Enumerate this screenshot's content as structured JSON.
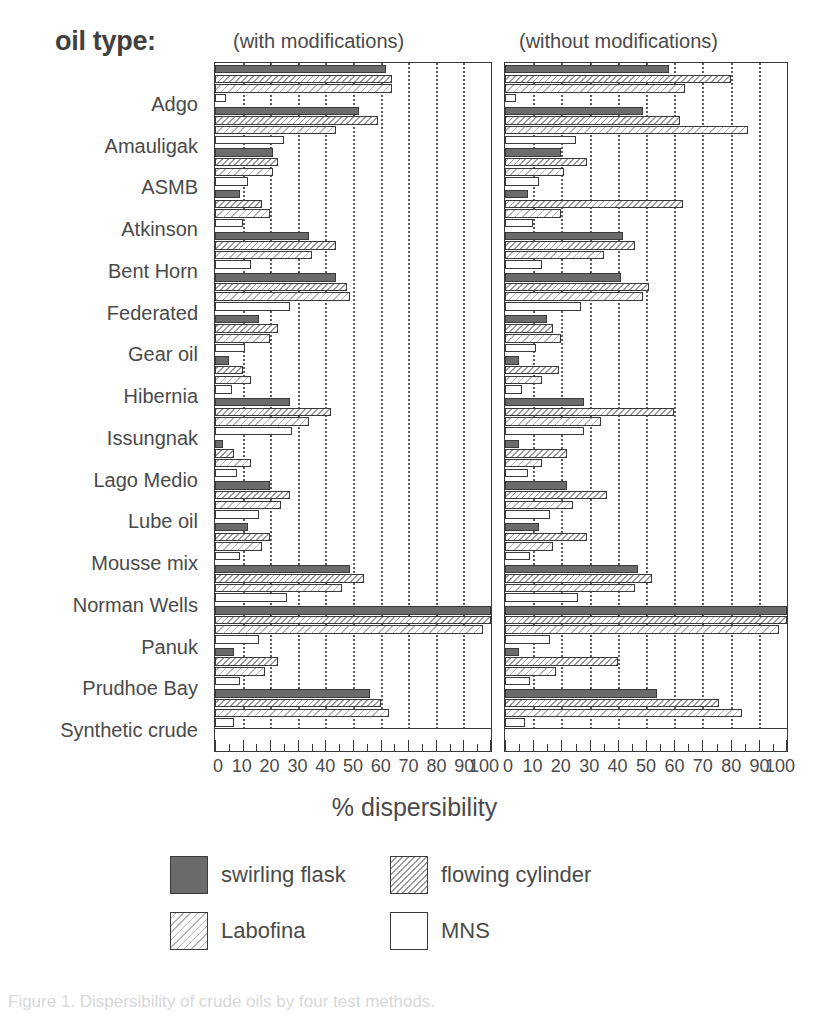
{
  "header": {
    "oil_type_label": "oil type:",
    "panel_left_title": "(with modifications)",
    "panel_right_title": "(without modifications)"
  },
  "axis": {
    "xlabel": "% dispersibility",
    "ticks": [
      "0",
      "10",
      "20",
      "30",
      "40",
      "50",
      "60",
      "70",
      "80",
      "90",
      "100"
    ]
  },
  "legend": {
    "items": [
      {
        "name": "swirling flask",
        "pattern": "solid-dark"
      },
      {
        "name": "flowing cylinder",
        "pattern": "diagonal-hatch-dense"
      },
      {
        "name": "Labofina",
        "pattern": "diagonal-hatch-light"
      },
      {
        "name": "MNS",
        "pattern": "empty-white"
      }
    ]
  },
  "caption": "Figure 1.  Dispersibility of crude oils by four test methods.",
  "chart_data": {
    "type": "bar",
    "orientation": "horizontal",
    "title": "",
    "xlabel": "% dispersibility",
    "ylabel": "oil type",
    "xlim": [
      0,
      100
    ],
    "xticks": [
      0,
      10,
      20,
      30,
      40,
      50,
      60,
      70,
      80,
      90,
      100
    ],
    "grid": "vertical-dotted",
    "legend_position": "below",
    "series_names": [
      "swirling flask",
      "flowing cylinder",
      "Labofina",
      "MNS"
    ],
    "categories": [
      "Adgo",
      "Amauligak",
      "ASMB",
      "Atkinson",
      "Bent Horn",
      "Federated",
      "Gear oil",
      "Hibernia",
      "Issungnak",
      "Lago Medio",
      "Lube oil",
      "Mousse mix",
      "Norman Wells",
      "Panuk",
      "Prudhoe Bay",
      "Synthetic crude"
    ],
    "panels": [
      {
        "name": "with modifications",
        "series": [
          {
            "name": "swirling flask",
            "values": [
              62,
              52,
              21,
              9,
              34,
              44,
              16,
              5,
              27,
              3,
              20,
              12,
              49,
              100,
              7,
              56
            ]
          },
          {
            "name": "flowing cylinder",
            "values": [
              64,
              59,
              23,
              17,
              44,
              48,
              23,
              10,
              42,
              7,
              27,
              20,
              54,
              100,
              23,
              60
            ]
          },
          {
            "name": "Labofina",
            "values": [
              64,
              44,
              21,
              20,
              35,
              49,
              20,
              13,
              34,
              13,
              24,
              17,
              46,
              97,
              18,
              63
            ]
          },
          {
            "name": "MNS",
            "values": [
              4,
              25,
              12,
              10,
              13,
              27,
              11,
              6,
              28,
              8,
              16,
              9,
              26,
              16,
              9,
              7
            ]
          }
        ]
      },
      {
        "name": "without modifications",
        "series": [
          {
            "name": "swirling flask",
            "values": [
              58,
              49,
              20,
              8,
              42,
              41,
              15,
              5,
              28,
              5,
              22,
              12,
              47,
              100,
              5,
              54
            ]
          },
          {
            "name": "flowing cylinder",
            "values": [
              80,
              62,
              29,
              63,
              46,
              51,
              17,
              19,
              60,
              22,
              36,
              29,
              52,
              100,
              40,
              76
            ]
          },
          {
            "name": "Labofina",
            "values": [
              64,
              86,
              21,
              20,
              35,
              49,
              20,
              13,
              34,
              13,
              24,
              17,
              46,
              97,
              18,
              84
            ]
          },
          {
            "name": "MNS",
            "values": [
              4,
              25,
              12,
              10,
              13,
              27,
              11,
              6,
              28,
              8,
              16,
              9,
              26,
              16,
              9,
              7
            ]
          }
        ]
      }
    ]
  }
}
